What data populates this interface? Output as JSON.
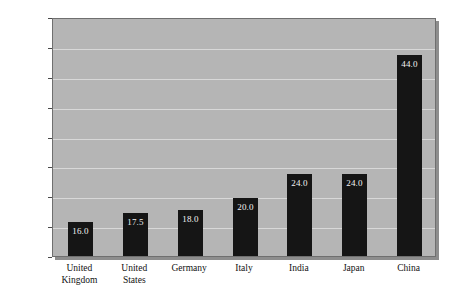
{
  "chart_data": {
    "type": "bar",
    "title": "",
    "xlabel": "",
    "ylabel": "Percent of GDP",
    "ylim": [
      10,
      50
    ],
    "ytick_values": [
      10,
      15,
      20,
      25,
      30,
      35,
      40,
      45,
      50
    ],
    "ytick_labels": [
      "10",
      "15",
      "20",
      "25",
      "30",
      "35",
      "40",
      "45",
      "50"
    ],
    "grid": true,
    "legend": "none",
    "categories": [
      "United Kingdom",
      "United States",
      "Germany",
      "Italy",
      "India",
      "Japan",
      "China"
    ],
    "category_lines": [
      [
        "United",
        "Kingdom"
      ],
      [
        "United",
        "States"
      ],
      [
        "Germany"
      ],
      [
        "Italy"
      ],
      [
        "India"
      ],
      [
        "Japan"
      ],
      [
        "China"
      ]
    ],
    "values": [
      16.0,
      17.5,
      18.0,
      20.0,
      24.0,
      24.0,
      44.0
    ],
    "value_labels": [
      "16.0",
      "17.5",
      "18.0",
      "20.0",
      "24.0",
      "24.0",
      "44.0"
    ],
    "colors": {
      "bar": "#151515",
      "bar_value_text": "#f2f2f2",
      "plot_background": "#b5b5b5",
      "gridline": "#d8d8d8",
      "plot_border": "#6f6f6f",
      "page_background": "#ffffff",
      "axis_text": "#111111"
    }
  }
}
